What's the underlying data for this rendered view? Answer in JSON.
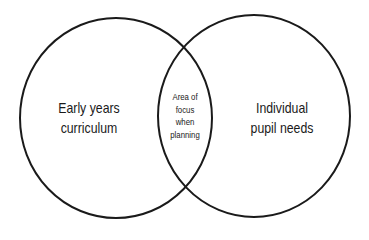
{
  "diagram": {
    "type": "venn",
    "stroke_color": "#1a1a1a",
    "background": "#ffffff",
    "sets": [
      {
        "id": "left",
        "label_lines": [
          "Early years",
          "curriculum"
        ],
        "cx": 116,
        "cy": 118,
        "rx": 96,
        "ry": 100
      },
      {
        "id": "right",
        "label_lines": [
          "Individual",
          "pupil needs"
        ],
        "cx": 254,
        "cy": 116,
        "rx": 96,
        "ry": 101
      }
    ],
    "intersection": {
      "label_lines": [
        "Area of",
        "focus",
        "when",
        "planning"
      ]
    }
  }
}
